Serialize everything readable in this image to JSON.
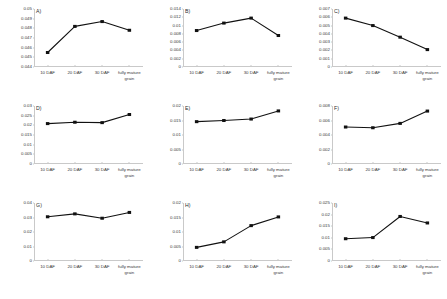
{
  "figure": {
    "panel_count": 9,
    "x_categories": [
      "10 DAF",
      "20 DAF",
      "30 DAF",
      "fully mature grain"
    ],
    "marker_color": "#111111",
    "line_color": "#111111",
    "axis_color": "#c9c9c9"
  },
  "chart_data": [
    {
      "type": "line",
      "title": "A)",
      "xlabel": "",
      "ylabel": "",
      "categories": [
        "10 DAF",
        "20 DAF",
        "30 DAF",
        "fully mature grain"
      ],
      "values": [
        0.0455,
        0.0482,
        0.0487,
        0.0478
      ],
      "ylim": [
        0.044,
        0.05
      ],
      "yticks": [
        "0.05",
        "0.049",
        "0.048",
        "0.047",
        "0.046",
        "0.045",
        "0.044"
      ],
      "grid": false,
      "legend": "none"
    },
    {
      "type": "line",
      "title": "B)",
      "xlabel": "",
      "ylabel": "",
      "categories": [
        "10 DAF",
        "20 DAF",
        "30 DAF",
        "fully mature grain"
      ],
      "values": [
        0.0088,
        0.0106,
        0.0118,
        0.0076
      ],
      "ylim": [
        0,
        0.014
      ],
      "yticks": [
        "0.014",
        "0.012",
        "0.01",
        "0.008",
        "0.006",
        "0.004",
        "0.002",
        "0"
      ],
      "grid": false,
      "legend": "none"
    },
    {
      "type": "line",
      "title": "C)",
      "xlabel": "",
      "ylabel": "",
      "categories": [
        "10 DAF",
        "20 DAF",
        "30 DAF",
        "fully mature grain"
      ],
      "values": [
        0.0059,
        0.005,
        0.0036,
        0.0021
      ],
      "ylim": [
        0,
        0.007
      ],
      "yticks": [
        "0.007",
        "0.006",
        "0.005",
        "0.004",
        "0.003",
        "0.002",
        "0.001",
        "0"
      ],
      "grid": false,
      "legend": "none"
    },
    {
      "type": "line",
      "title": "D)",
      "xlabel": "",
      "ylabel": "",
      "categories": [
        "10 DAF",
        "20 DAF",
        "30 DAF",
        "fully mature grain"
      ],
      "values": [
        0.0209,
        0.0216,
        0.0214,
        0.0256
      ],
      "ylim": [
        0,
        0.03
      ],
      "yticks": [
        "0.03",
        "0.025",
        "0.02",
        "0.015",
        "0.01",
        "0.005",
        "0"
      ],
      "grid": false,
      "legend": "none"
    },
    {
      "type": "line",
      "title": "E)",
      "xlabel": "",
      "ylabel": "",
      "categories": [
        "10 DAF",
        "20 DAF",
        "30 DAF",
        "fully mature grain"
      ],
      "values": [
        0.0146,
        0.015,
        0.0155,
        0.0183
      ],
      "ylim": [
        0,
        0.02
      ],
      "yticks": [
        "0.02",
        "0.015",
        "0.01",
        "0.005",
        "0"
      ],
      "grid": false,
      "legend": "none"
    },
    {
      "type": "line",
      "title": "F)",
      "xlabel": "",
      "ylabel": "",
      "categories": [
        "10 DAF",
        "20 DAF",
        "30 DAF",
        "fully mature grain"
      ],
      "values": [
        0.0051,
        0.005,
        0.0056,
        0.0073
      ],
      "ylim": [
        0,
        0.008
      ],
      "yticks": [
        "0.008",
        "0.006",
        "0.004",
        "0.002",
        "0"
      ],
      "grid": false,
      "legend": "none"
    },
    {
      "type": "line",
      "title": "G)",
      "xlabel": "",
      "ylabel": "",
      "categories": [
        "10 DAF",
        "20 DAF",
        "30 DAF",
        "fully mature grain"
      ],
      "values": [
        0.0305,
        0.0325,
        0.0295,
        0.0335
      ],
      "ylim": [
        0,
        0.04
      ],
      "yticks": [
        "0.04",
        "0.03",
        "0.02",
        "0.01",
        "0"
      ],
      "grid": false,
      "legend": "none"
    },
    {
      "type": "line",
      "title": "H)",
      "xlabel": "",
      "ylabel": "",
      "categories": [
        "10 DAF",
        "20 DAF",
        "30 DAF",
        "fully mature grain"
      ],
      "values": [
        0.0047,
        0.0066,
        0.0122,
        0.0152
      ],
      "ylim": [
        0,
        0.02
      ],
      "yticks": [
        "0.02",
        "0.015",
        "0.01",
        "0.005",
        "0"
      ],
      "grid": false,
      "legend": "none"
    },
    {
      "type": "line",
      "title": "I)",
      "xlabel": "",
      "ylabel": "",
      "categories": [
        "10 DAF",
        "20 DAF",
        "30 DAF",
        "fully mature grain"
      ],
      "values": [
        0.0096,
        0.0101,
        0.0192,
        0.0164
      ],
      "ylim": [
        0,
        0.025
      ],
      "yticks": [
        "0.025",
        "0.02",
        "0.015",
        "0.01",
        "0.005",
        "0"
      ],
      "grid": false,
      "legend": "none"
    }
  ]
}
